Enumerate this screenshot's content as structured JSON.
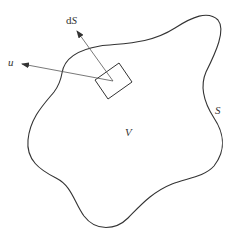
{
  "diagram": {
    "labels": {
      "normal_d": "d",
      "normal_S": "S",
      "velocity": "u",
      "surface": "S",
      "volume": "V"
    },
    "colors": {
      "stroke": "#333333",
      "background": "#ffffff"
    },
    "elements": [
      {
        "id": "surface-S",
        "type": "closed-curve",
        "label": "S"
      },
      {
        "id": "volume-V",
        "type": "region",
        "label": "V"
      },
      {
        "id": "surface-element-dS",
        "type": "square"
      },
      {
        "id": "normal-vector",
        "type": "arrow",
        "label": "dS"
      },
      {
        "id": "velocity-vector",
        "type": "arrow",
        "label": "u"
      }
    ]
  }
}
